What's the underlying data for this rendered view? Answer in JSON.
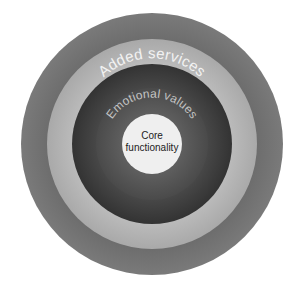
{
  "diagram": {
    "type": "concentric-circles",
    "center": [
      152,
      144
    ],
    "rings": [
      {
        "name": "outer-ring",
        "radius": 131,
        "color": "#757575"
      },
      {
        "name": "light-ring",
        "radius": 105,
        "color": "#b5b5b5"
      },
      {
        "name": "added-services-ring",
        "radius": 80,
        "color": "#3f3f3f"
      },
      {
        "name": "emotional-values-ring",
        "radius": 56,
        "color": "#575757"
      },
      {
        "name": "core",
        "radius": 30,
        "color": "#efefef"
      }
    ],
    "labels": {
      "added_services": "Added services",
      "emotional_values": "Emotional values",
      "core_line1": "Core",
      "core_line2": "functionality"
    },
    "text_colors": {
      "ring_labels": "#f2f2f2",
      "emotional_label": "#bdbdbd",
      "core_label": "#222222"
    }
  }
}
